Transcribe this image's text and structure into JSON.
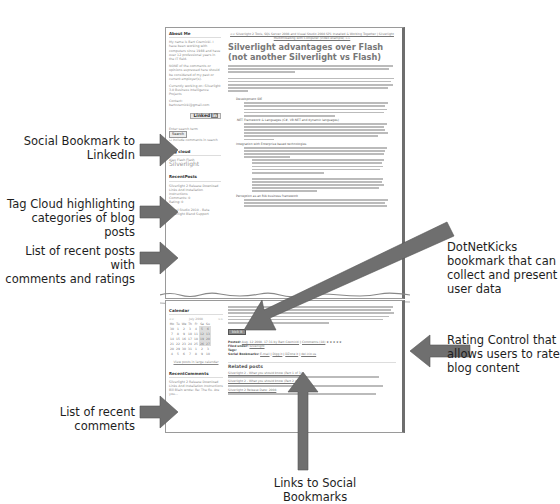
{
  "figure": {
    "callouts": {
      "linkedin": "Social Bookmark to\nLinkedIn",
      "tag_cloud": "Tag Cloud highlighting\ncategories of blog posts",
      "recent_posts": "List of recent posts with\ncomments and ratings",
      "recent_comments": "List of recent comments",
      "dotnetkicks": "DotNetKicks\nbookmark that can\ncollect and present\nuser data",
      "rating": "Rating Control that\nallows users to rate\nblog content",
      "social_links": "Links to Social Bookmarks"
    },
    "arrow_color": "#6f6f6f"
  },
  "blog": {
    "sidebar": {
      "about_title": "About Me",
      "about_text": "My name is Bart Czernicki. I have been working with computers since 1988 and have over 12 professional years in the IT field.",
      "disclaimer": "NONE of the comments or opinions expressed here should be considered of my past or current employer(s).",
      "current_work": "Currently working on: Silverlight 3.0 Business Intelligence Projects",
      "contact": "Contact: bartczernicki@gmail.com",
      "linkedin_label": "Linked",
      "linkedin_in": "in",
      "search_label": "Enter search term",
      "search_button": "Search",
      "search_option": "Include comments in search",
      "tag_cloud_title": "Tag cloud",
      "tag_small": "Ajax  Flash  Flash",
      "tag_big": "Silverlight",
      "recent_posts_title": "RecentPosts",
      "recent_post_1": "Silverlight 2 Release Download Links And Installation Instructions",
      "recent_post_1_meta": "Comments: 0",
      "recent_post_1_rating": "Rating: 0",
      "recent_post_2": "Visual Studio 2010 - Beta Silverlight Blend Support",
      "calendar_title": "Calendar",
      "calendar_month": "July 2008",
      "calendar_prev": "<<",
      "calendar_next": ">>",
      "calendar_days": [
        "Mo",
        "Tu",
        "We",
        "Th",
        "Fr",
        "Sa",
        "Su"
      ],
      "calendar_weeks": [
        [
          "30",
          "1",
          "2",
          "3",
          "4",
          "5",
          "6"
        ],
        [
          "7",
          "8",
          "9",
          "10",
          "11",
          "12",
          "13"
        ],
        [
          "14",
          "15",
          "16",
          "17",
          "18",
          "19",
          "20"
        ],
        [
          "21",
          "22",
          "23",
          "24",
          "25",
          "26",
          "27"
        ],
        [
          "28",
          "29",
          "30",
          "31",
          "1",
          "2",
          "3"
        ],
        [
          "4",
          "5",
          "6",
          "7",
          "8",
          "9",
          "10"
        ]
      ],
      "calendar_link": "View posts in large calendar",
      "recent_comments_title": "RecentComments",
      "recent_comment_1": "Silverlight 2 Release Download Links And Installation Instructions",
      "recent_comment_2": "Bill Blain wrote: Re: The fix. Are you..."
    },
    "main": {
      "breadcrumb": "<< Silverlight 2 Tools, SQL Server 2008 and Visual Studio 2008 SP1 Installed & Working Together | Silverlight Multithreading with Computer (Video example) >>",
      "title": "Silverlight advantages over Flash (not another Silverlight vs Flash)",
      "list_items": [
        "Development IDE",
        ".NET Framework & Languages (C#, VB.NET and dynamic languages)",
        "Integration with Enterprise based technologies",
        "Perception as an RIA business framework"
      ],
      "kick_label": "kick it",
      "posted_label": "Posted:",
      "posted_value": "Aug. 12 2008, 17:31 by Bart Czernicki",
      "comments_link": "Comments (18)",
      "rating_stars": "★★★★★",
      "filed_label": "Filed under:",
      "filed_value": "Silverlight",
      "tags_label": "Tags:",
      "social_label": "Social Bookmarks:",
      "social_links": [
        "E-mail",
        "Digg it",
        "DZone it",
        "del.icio.us"
      ],
      "related_title": "Related posts",
      "related": [
        "Silverlight 2 - What you should know (Part 1 of 3)",
        "Silverlight 2 - What you should know (Part 2 of 3)",
        "Silverlight 2 Release Date: 2008"
      ]
    }
  }
}
